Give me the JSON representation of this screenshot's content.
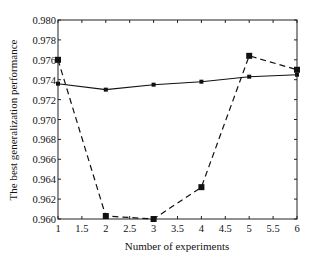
{
  "chart_data": {
    "type": "line",
    "title": "",
    "xlabel": "Number of experiments",
    "ylabel": "The best generalization performance",
    "xlim": [
      1,
      6
    ],
    "ylim": [
      0.96,
      0.98
    ],
    "x_ticks": [
      "1",
      "1.5",
      "2",
      "2.5",
      "3",
      "3.5",
      "4",
      "4.5",
      "5",
      "5.5",
      "6"
    ],
    "x_tick_values": [
      1,
      1.5,
      2,
      2.5,
      3,
      3.5,
      4,
      4.5,
      5,
      5.5,
      6
    ],
    "y_ticks": [
      "0.960",
      "0.962",
      "0.964",
      "0.966",
      "0.968",
      "0.970",
      "0.972",
      "0.974",
      "0.976",
      "0.978",
      "0.980"
    ],
    "y_tick_values": [
      0.96,
      0.962,
      0.964,
      0.966,
      0.968,
      0.97,
      0.972,
      0.974,
      0.976,
      0.978,
      0.98
    ],
    "grid": false,
    "legend": null,
    "x": [
      1,
      2,
      3,
      4,
      5,
      6
    ],
    "series": [
      {
        "name": "solid-series",
        "style": "solid",
        "marker": "small-square",
        "color": "#111111",
        "values": [
          0.9736,
          0.973,
          0.9735,
          0.9738,
          0.9743,
          0.9745
        ]
      },
      {
        "name": "dashed-series",
        "style": "dashed",
        "marker": "square",
        "color": "#111111",
        "values": [
          0.976,
          0.9603,
          0.96,
          0.9632,
          0.9764,
          0.975
        ]
      }
    ]
  }
}
